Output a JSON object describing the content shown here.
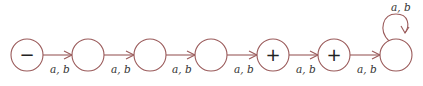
{
  "diagram": {
    "type": "finite-automaton",
    "states": [
      {
        "id": "s1",
        "mark": "−",
        "role": "start"
      },
      {
        "id": "s2",
        "mark": ""
      },
      {
        "id": "s3",
        "mark": ""
      },
      {
        "id": "s4",
        "mark": ""
      },
      {
        "id": "s5",
        "mark": "+",
        "role": "final"
      },
      {
        "id": "s6",
        "mark": "+",
        "role": "final"
      },
      {
        "id": "s7",
        "mark": ""
      }
    ],
    "transitions": [
      {
        "from": "s1",
        "to": "s2",
        "label": "a, b"
      },
      {
        "from": "s2",
        "to": "s3",
        "label": "a, b"
      },
      {
        "from": "s3",
        "to": "s4",
        "label": "a, b"
      },
      {
        "from": "s4",
        "to": "s5",
        "label": "a, b"
      },
      {
        "from": "s5",
        "to": "s6",
        "label": "a, b"
      },
      {
        "from": "s6",
        "to": "s7",
        "label": "a, b"
      },
      {
        "from": "s7",
        "to": "s7",
        "label": "a, b"
      }
    ],
    "colors": {
      "stroke": "#9a5a5a",
      "text": "#333333"
    }
  }
}
